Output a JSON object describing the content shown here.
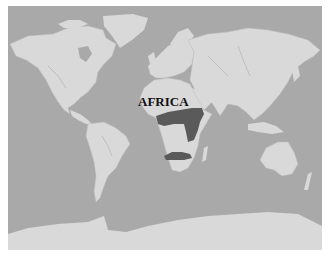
{
  "map": {
    "type": "world map",
    "style": "grayscale physical",
    "colors": {
      "ocean": "#a9a9a9",
      "land": "#d9d9d9",
      "highlight": "#5a5a5a",
      "rivers": "#9a9a9a",
      "frame_margin": "#ffffff"
    },
    "labels": [
      {
        "text": "AFRICA",
        "region": "africa"
      }
    ],
    "highlighted_regions": [
      {
        "name": "central-africa-band",
        "description": "dark band across central Africa extending to east Africa"
      },
      {
        "name": "southern-africa-band",
        "description": "dark band across southern Africa"
      }
    ]
  }
}
